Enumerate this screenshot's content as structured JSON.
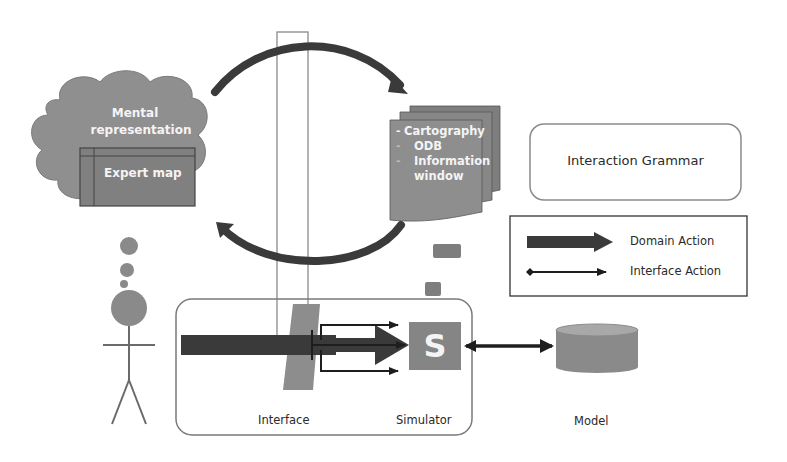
{
  "figure": {
    "cloud": {
      "title_line1": "Mental",
      "title_line2": "representation",
      "inner_box_label": "Expert map"
    },
    "documents": {
      "items": [
        {
          "bullet": "-",
          "label": "Cartography"
        },
        {
          "bullet": "-",
          "label": "ODB"
        },
        {
          "bullet": "-",
          "label": "Information"
        },
        {
          "bullet": "",
          "label": "window"
        }
      ]
    },
    "interaction_grammar": {
      "label": "Interaction Grammar"
    },
    "legend": {
      "items": [
        {
          "symbol": "thick-arrow",
          "label": "Domain Action"
        },
        {
          "symbol": "thin-double-arrow",
          "label": "Interface Action"
        }
      ]
    },
    "system": {
      "interface_label": "Interface",
      "simulator_label": "Simulator",
      "simulator_glyph": "S",
      "model_label": "Model"
    },
    "colors": {
      "shape_fill": "#8a8a8a",
      "shape_dark": "#555555",
      "arrow_dark": "#3a3a3a",
      "outline": "#7a7a7a",
      "text_dark": "#2a2a2a",
      "text_light": "#f4f4f4"
    }
  }
}
